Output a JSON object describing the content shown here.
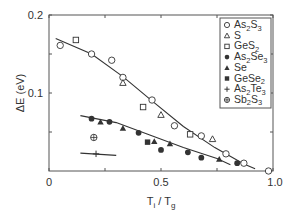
{
  "chart_data": {
    "type": "scatter",
    "title": "",
    "xlabel": "Ti / Tg",
    "ylabel": "ΔE (eV)",
    "xlim": [
      0,
      1.0
    ],
    "ylim": [
      0,
      0.2
    ],
    "xticks": [
      0,
      0.5,
      1.0
    ],
    "xtick_labels": [
      "0",
      "0.5",
      "1.0"
    ],
    "yticks": [
      0.1,
      0.2
    ],
    "ytick_labels": [
      "0.1",
      "0.2"
    ],
    "yminor_ticks": [
      0.05,
      0.15
    ],
    "xminor_ticks": [
      0.25,
      0.75
    ],
    "grid": false,
    "legend_position": "upper right",
    "series": [
      {
        "name": "As2S3",
        "label_html": [
          "As",
          "2",
          "S",
          "3"
        ],
        "marker": "open-circle",
        "points": [
          [
            0.05,
            0.161
          ],
          [
            0.19,
            0.15
          ],
          [
            0.28,
            0.142
          ],
          [
            0.33,
            0.12
          ],
          [
            0.46,
            0.091
          ],
          [
            0.56,
            0.058
          ],
          [
            0.68,
            0.045
          ],
          [
            0.79,
            0.022
          ],
          [
            0.87,
            0.01
          ],
          [
            0.98,
            0.0
          ]
        ]
      },
      {
        "name": "S",
        "label_html": [
          "S"
        ],
        "marker": "open-triangle",
        "points": [
          [
            0.33,
            0.113
          ],
          [
            0.5,
            0.072
          ],
          [
            0.73,
            0.041
          ]
        ]
      },
      {
        "name": "GeS2",
        "label_html": [
          "GeS",
          "2"
        ],
        "marker": "open-square",
        "points": [
          [
            0.12,
            0.168
          ],
          [
            0.42,
            0.082
          ],
          [
            0.63,
            0.047
          ]
        ]
      },
      {
        "name": "As2Se3",
        "label_html": [
          "As",
          "2",
          "Se",
          "3"
        ],
        "marker": "filled-circle",
        "points": [
          [
            0.19,
            0.067
          ],
          [
            0.27,
            0.063
          ],
          [
            0.4,
            0.049
          ],
          [
            0.5,
            0.027
          ],
          [
            0.62,
            0.024
          ],
          [
            0.68,
            0.017
          ],
          [
            0.84,
            0.01
          ]
        ]
      },
      {
        "name": "Se",
        "label_html": [
          "Se"
        ],
        "marker": "filled-triangle",
        "points": [
          [
            0.23,
            0.063
          ],
          [
            0.33,
            0.055
          ],
          [
            0.47,
            0.038
          ],
          [
            0.54,
            0.035
          ],
          [
            0.76,
            0.015
          ]
        ]
      },
      {
        "name": "GeSe2",
        "label_html": [
          "GeSe",
          "2"
        ],
        "marker": "filled-square",
        "points": [
          [
            0.44,
            0.037
          ]
        ]
      },
      {
        "name": "As2Te3",
        "label_html": [
          "As",
          "2",
          "Te",
          "3"
        ],
        "marker": "plus",
        "points": [
          [
            0.21,
            0.022
          ]
        ]
      },
      {
        "name": "Sb2S3",
        "label_html": [
          "Sb",
          "2",
          "S",
          "3"
        ],
        "marker": "circle-plus",
        "points": [
          [
            0.2,
            0.043
          ]
        ]
      }
    ],
    "fit_lines": [
      {
        "name": "upper-fit",
        "points": [
          [
            0.03,
            0.17
          ],
          [
            0.19,
            0.15
          ],
          [
            0.33,
            0.121
          ],
          [
            0.46,
            0.09
          ],
          [
            0.6,
            0.057
          ],
          [
            0.74,
            0.03
          ],
          [
            0.87,
            0.009
          ],
          [
            0.92,
            0.003
          ]
        ]
      },
      {
        "name": "lower-fit",
        "points": [
          [
            0.14,
            0.071
          ],
          [
            0.3,
            0.062
          ],
          [
            0.45,
            0.046
          ],
          [
            0.6,
            0.03
          ],
          [
            0.75,
            0.016
          ],
          [
            0.81,
            0.008
          ]
        ]
      },
      {
        "name": "as2te3-fit",
        "points": [
          [
            0.14,
            0.023
          ],
          [
            0.3,
            0.02
          ]
        ]
      }
    ]
  },
  "legend": {
    "items": [
      {
        "sym": "○",
        "base": "As",
        "s1": "2",
        "mid": "S",
        "s2": "3"
      },
      {
        "sym": "△",
        "base": "S",
        "s1": "",
        "mid": "",
        "s2": ""
      },
      {
        "sym": "□",
        "base": "GeS",
        "s1": "2",
        "mid": "",
        "s2": ""
      },
      {
        "sym": "●",
        "base": "As",
        "s1": "2",
        "mid": "Se",
        "s2": "3"
      },
      {
        "sym": "▲",
        "base": "Se",
        "s1": "",
        "mid": "",
        "s2": ""
      },
      {
        "sym": "■",
        "base": "GeSe",
        "s1": "2",
        "mid": "",
        "s2": ""
      },
      {
        "sym": "+",
        "base": "As",
        "s1": "2",
        "mid": "Te",
        "s2": "3"
      },
      {
        "sym": "⊕",
        "base": "Sb",
        "s1": "2",
        "mid": "S",
        "s2": "3"
      }
    ]
  },
  "axes": {
    "ylabel": "ΔE (eV)",
    "xlabel_main": "T",
    "xlabel_sub1": "i",
    "xlabel_sep": " / T",
    "xlabel_sub2": "g",
    "y_tick_02": "0.2",
    "y_tick_01": "0.1",
    "x_tick_0": "0",
    "x_tick_05": "0.5",
    "x_tick_10": "1.0"
  },
  "colors": {
    "ink": "#333333",
    "frame": "#555555",
    "background": "#ffffff"
  }
}
